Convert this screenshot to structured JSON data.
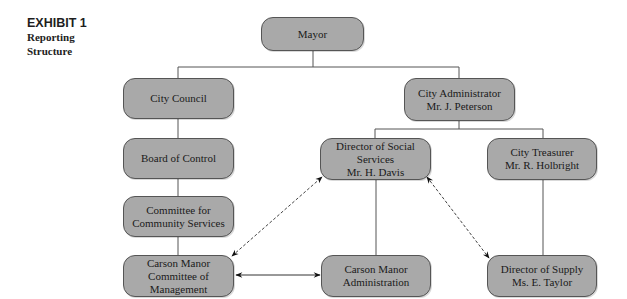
{
  "exhibit": {
    "number": "EXHIBIT 1",
    "title_line1": "Reporting",
    "title_line2": "Structure"
  },
  "nodes": {
    "mayor": {
      "line1": "Mayor"
    },
    "city_council": {
      "line1": "City Council"
    },
    "board_of_control": {
      "line1": "Board of Control"
    },
    "committee_community_services": {
      "line1": "Committee for",
      "line2": "Community Services"
    },
    "carson_manor_committee": {
      "line1": "Carson Manor",
      "line2": "Committee of",
      "line3": "Management"
    },
    "city_administrator": {
      "line1": "City Administrator",
      "line2": "Mr. J. Peterson"
    },
    "director_social_services": {
      "line1": "Director of Social",
      "line2": "Services",
      "line3": "Mr. H. Davis"
    },
    "city_treasurer": {
      "line1": "City Treasurer",
      "line2": "Mr. R. Holbright"
    },
    "carson_manor_administration": {
      "line1": "Carson Manor",
      "line2": "Administration"
    },
    "director_of_supply": {
      "line1": "Director of Supply",
      "line2": "Ms. E. Taylor"
    }
  },
  "connections": {
    "solid": [
      [
        "Mayor",
        "City Council"
      ],
      [
        "Mayor",
        "City Administrator"
      ],
      [
        "City Council",
        "Board of Control"
      ],
      [
        "Board of Control",
        "Committee for Community Services"
      ],
      [
        "Committee for Community Services",
        "Carson Manor Committee of Management"
      ],
      [
        "City Administrator",
        "Director of Social Services"
      ],
      [
        "City Administrator",
        "City Treasurer"
      ],
      [
        "Director of Social Services",
        "Carson Manor Administration"
      ],
      [
        "City Treasurer",
        "Director of Supply"
      ]
    ],
    "bidirectional_solid": [
      [
        "Carson Manor Committee of Management",
        "Carson Manor Administration"
      ]
    ],
    "bidirectional_dashed": [
      [
        "Carson Manor Committee of Management",
        "Director of Social Services"
      ],
      [
        "Director of Social Services",
        "Director of Supply"
      ]
    ]
  },
  "colors": {
    "box_fill": "#a9a9a9",
    "box_border": "#555555",
    "line": "#555555"
  }
}
